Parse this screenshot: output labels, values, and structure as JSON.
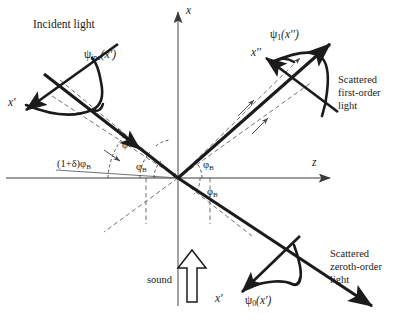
{
  "figure": {
    "kind": "acousto-optic-bragg-diffraction-diagram",
    "background": "#ffffff",
    "ink": "#1b1b1b",
    "axes": {
      "vertical_label": "x",
      "horizontal_label": "z",
      "origin": [
        178,
        178
      ]
    },
    "labels": {
      "incident_light": "Incident light",
      "incident_profile": {
        "psi": "ψ",
        "sub": "inc",
        "arg": "(x′)"
      },
      "incident_frame_axis": "x′",
      "first_order_profile": {
        "psi": "ψ",
        "sub": "1",
        "arg": "(x′′)"
      },
      "first_order_frame_axis": "x′′",
      "scattered_first_order": "Scattered\nfirst-order\nlight",
      "zeroth_order_profile": {
        "psi": "ψ",
        "sub": "0",
        "arg": "(x′)"
      },
      "zeroth_order_frame_axis": "x′",
      "scattered_zeroth_order": "Scattered\nzeroth-order\nlight",
      "sound": "sound"
    },
    "angles": [
      {
        "name": "incident-mismatch-angle",
        "text": "(1+δ)φ",
        "sub": "B",
        "x": 57,
        "y": 158
      },
      {
        "name": "phi-prime-angle",
        "text": "φ′",
        "sub": "",
        "x": 122,
        "y": 139
      },
      {
        "name": "bragg-angle-incident",
        "text": "φ",
        "sub": "B",
        "x": 136,
        "y": 161
      },
      {
        "name": "bragg-angle-first-order",
        "text": "φ",
        "sub": "B",
        "x": 203,
        "y": 159
      },
      {
        "name": "bragg-angle-zeroth-order",
        "text": "φ",
        "sub": "B",
        "x": 207,
        "y": 186
      }
    ]
  }
}
